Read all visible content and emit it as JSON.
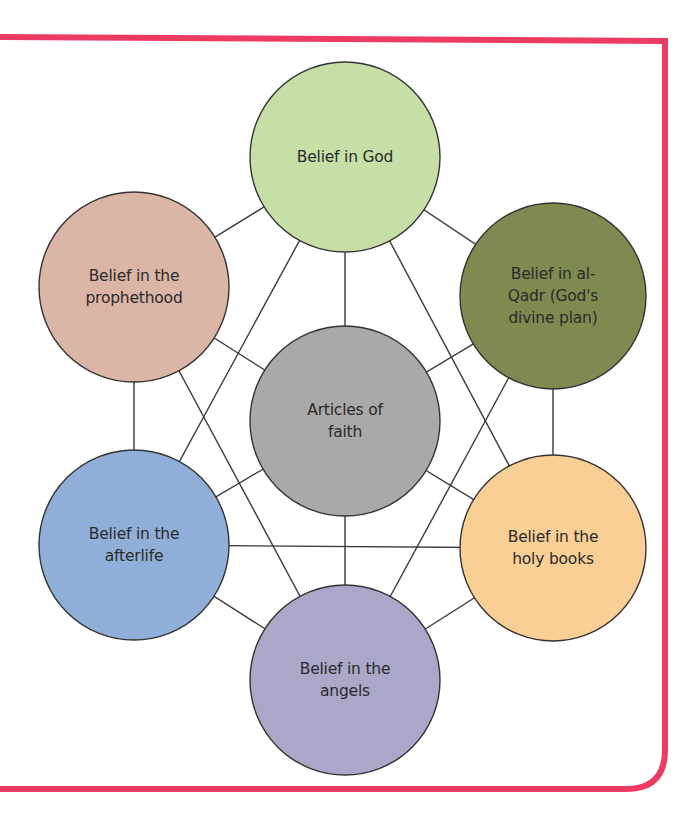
{
  "diagram": {
    "title": "Articles of faith",
    "frame": {
      "color": "#ee3b63",
      "stroke_width": 6
    },
    "line_color": "#3a3a3a",
    "outline_color": "#333333",
    "nodes": [
      {
        "id": "center",
        "label": "Articles of\nfaith",
        "fill": "#a9a9a9",
        "cx": 345,
        "cy": 421,
        "r": 95
      },
      {
        "id": "god",
        "label": "Belief in God",
        "fill": "#c6dfa7",
        "cx": 345,
        "cy": 157,
        "r": 95
      },
      {
        "id": "prophethood",
        "label": "Belief in the\nprophethood",
        "fill": "#dbb5a5",
        "cx": 134,
        "cy": 287,
        "r": 95
      },
      {
        "id": "qadr",
        "label": "Belief in al-\nQadr (God's\ndivine plan)",
        "fill": "#7e8a4f",
        "cx": 553,
        "cy": 296,
        "r": 93
      },
      {
        "id": "afterlife",
        "label": "Belief in the\nafterlife",
        "fill": "#8fafd9",
        "cx": 134,
        "cy": 545,
        "r": 95
      },
      {
        "id": "holy-books",
        "label": "Belief in the\nholy books",
        "fill": "#f9cf95",
        "cx": 553,
        "cy": 548,
        "r": 93
      },
      {
        "id": "angels",
        "label": "Belief in the\nangels",
        "fill": "#aaa7c9",
        "cx": 345,
        "cy": 680,
        "r": 95
      }
    ],
    "edges": [
      [
        "center",
        "god"
      ],
      [
        "center",
        "prophethood"
      ],
      [
        "center",
        "qadr"
      ],
      [
        "center",
        "afterlife"
      ],
      [
        "center",
        "holy-books"
      ],
      [
        "center",
        "angels"
      ],
      [
        "god",
        "prophethood"
      ],
      [
        "god",
        "qadr"
      ],
      [
        "prophethood",
        "afterlife"
      ],
      [
        "qadr",
        "holy-books"
      ],
      [
        "afterlife",
        "angels"
      ],
      [
        "holy-books",
        "angels"
      ],
      [
        "god",
        "afterlife"
      ],
      [
        "god",
        "holy-books"
      ],
      [
        "prophethood",
        "angels"
      ],
      [
        "qadr",
        "angels"
      ],
      [
        "afterlife",
        "holy-books"
      ]
    ]
  }
}
